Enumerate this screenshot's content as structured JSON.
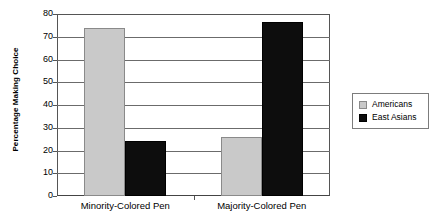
{
  "chart_data": {
    "type": "bar",
    "title": "",
    "xlabel": "",
    "ylabel": "Percentage Making Choice",
    "ylim": [
      0,
      80
    ],
    "yticks": [
      0,
      10,
      20,
      30,
      40,
      50,
      60,
      70,
      80
    ],
    "ytick_labels": [
      "0",
      "10",
      "20",
      "30",
      "40",
      "50",
      "60",
      "70",
      "80"
    ],
    "grid": true,
    "legend_position": "right",
    "categories": [
      "Minority-Colored Pen",
      "Majority-Colored Pen"
    ],
    "series": [
      {
        "name": "Americans",
        "color": "#c9c9c9",
        "values": [
          74,
          26
        ]
      },
      {
        "name": "East Asians",
        "color": "#0d0d0d",
        "values": [
          24,
          76.5
        ]
      }
    ]
  },
  "legend": {
    "entries": [
      {
        "label": "Americans"
      },
      {
        "label": "East Asians"
      }
    ]
  }
}
